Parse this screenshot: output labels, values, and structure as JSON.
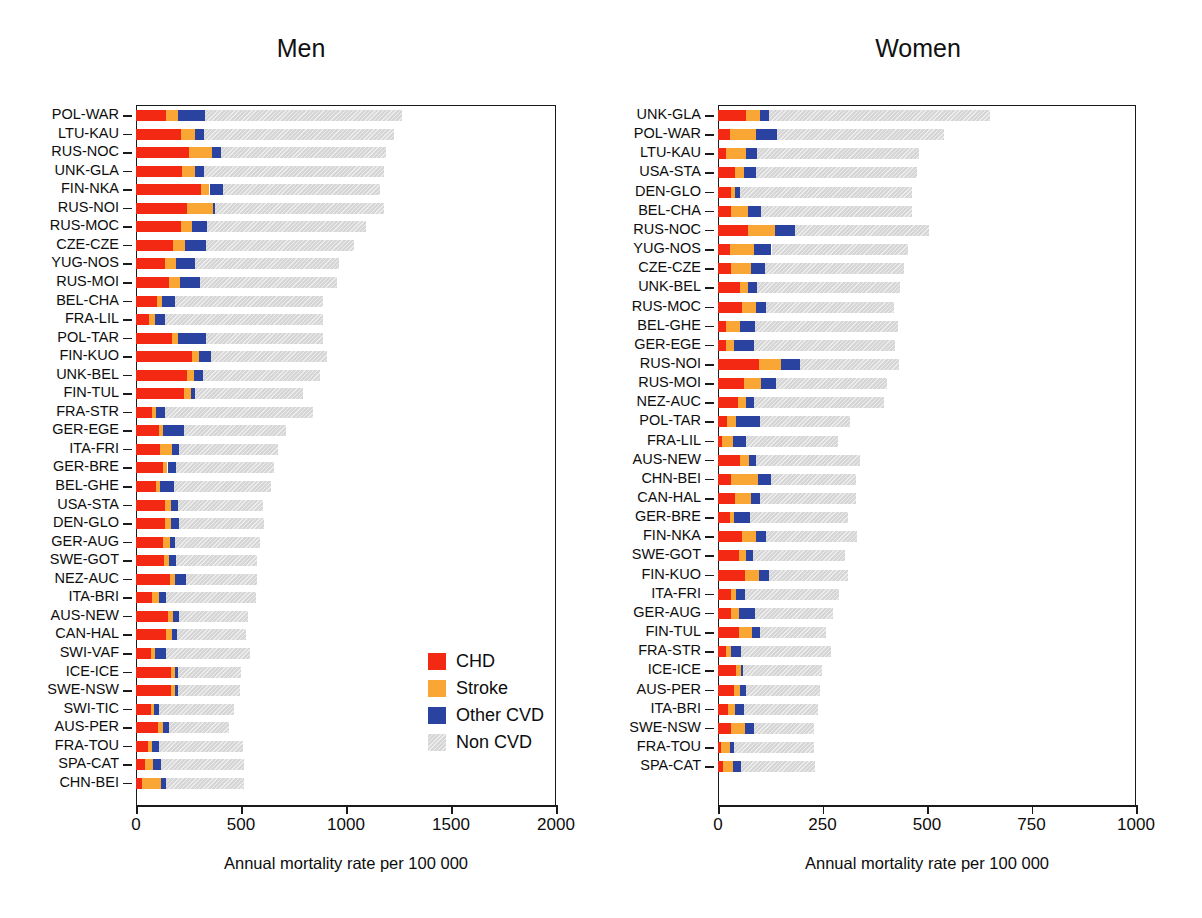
{
  "page": {
    "cropped_header_text": "",
    "background": "#ffffff"
  },
  "colors": {
    "chd": "#f42914",
    "stroke": "#f9a635",
    "other_cvd": "#2a42a0",
    "non_cvd": "#d6d6d6",
    "axis": "#1a1a1a",
    "text": "#0d0d0d"
  },
  "legend": {
    "items": [
      {
        "key": "chd",
        "label": "CHD",
        "color": "#f42914"
      },
      {
        "key": "stroke",
        "label": "Stroke",
        "color": "#f9a635"
      },
      {
        "key": "other",
        "label": "Other CVD",
        "color": "#2a42a0"
      },
      {
        "key": "non",
        "label": "Non  CVD",
        "color": "#d6d6d6"
      }
    ]
  },
  "chart_data": [
    {
      "type": "bar",
      "orientation": "horizontal",
      "stacked": true,
      "title": "Men",
      "xlabel": "Annual mortality rate per 100 000",
      "ylabel": "",
      "xlim": [
        0,
        2000
      ],
      "xticks": [
        0,
        500,
        1000,
        1500,
        2000
      ],
      "xticklabels": [
        "0",
        "500",
        "1000",
        "1500",
        "2000"
      ],
      "grid": false,
      "legend_position": "inside-lower-right",
      "series": [
        {
          "name": "CHD",
          "color": "#f42914"
        },
        {
          "name": "Stroke",
          "color": "#f9a635"
        },
        {
          "name": "Other CVD",
          "color": "#2a42a0"
        },
        {
          "name": "Non  CVD",
          "color": "#d6d6d6"
        }
      ],
      "categories": [
        "POL-WAR",
        "LTU-KAU",
        "RUS-NOC",
        "UNK-GLA",
        "FIN-NKA",
        "RUS-NOI",
        "RUS-MOC",
        "CZE-CZE",
        "YUG-NOS",
        "RUS-MOI",
        "BEL-CHA",
        "FRA-LIL",
        "POL-TAR",
        "FIN-KUO",
        "UNK-BEL",
        "FIN-TUL",
        "FRA-STR",
        "GER-EGE",
        "ITA-FRI",
        "GER-BRE",
        "BEL-GHE",
        "USA-STA",
        "DEN-GLO",
        "GER-AUG",
        "SWE-GOT",
        "NEZ-AUC",
        "ITA-BRI",
        "AUS-NEW",
        "CAN-HAL",
        "SWI-VAF",
        "ICE-ICE",
        "SWE-NSW",
        "SWI-TIC",
        "AUS-PER",
        "FRA-TOU",
        "SPA-CAT",
        "CHN-BEI"
      ],
      "values": {
        "CHD": [
          145,
          215,
          250,
          220,
          310,
          245,
          215,
          175,
          140,
          155,
          100,
          60,
          170,
          265,
          245,
          230,
          75,
          110,
          115,
          130,
          95,
          140,
          140,
          130,
          135,
          160,
          75,
          150,
          145,
          70,
          165,
          165,
          70,
          105,
          55,
          45,
          30
        ],
        "Stroke": [
          55,
          65,
          110,
          60,
          40,
          120,
          50,
          60,
          50,
          55,
          25,
          30,
          30,
          35,
          30,
          30,
          20,
          20,
          55,
          20,
          20,
          25,
          25,
          30,
          20,
          25,
          35,
          25,
          25,
          20,
          20,
          20,
          15,
          25,
          20,
          35,
          90
        ],
        "Other CVD": [
          130,
          45,
          45,
          45,
          65,
          10,
          75,
          100,
          90,
          95,
          60,
          50,
          135,
          55,
          45,
          20,
          45,
          100,
          35,
          40,
          65,
          35,
          40,
          25,
          35,
          55,
          35,
          30,
          25,
          55,
          15,
          15,
          25,
          25,
          35,
          40,
          25
        ],
        "Non  CVD": [
          935,
          905,
          785,
          855,
          745,
          805,
          755,
          705,
          685,
          650,
          705,
          750,
          555,
          555,
          555,
          515,
          705,
          485,
          470,
          465,
          465,
          405,
          405,
          405,
          385,
          335,
          425,
          330,
          330,
          400,
          300,
          295,
          355,
          290,
          400,
          395,
          370
        ]
      },
      "totals": [
        1265,
        1230,
        1190,
        1180,
        1160,
        1180,
        1095,
        1040,
        965,
        955,
        890,
        890,
        890,
        910,
        875,
        795,
        845,
        715,
        675,
        655,
        645,
        605,
        610,
        590,
        575,
        575,
        570,
        535,
        525,
        545,
        500,
        495,
        465,
        445,
        510,
        515,
        515
      ]
    },
    {
      "type": "bar",
      "orientation": "horizontal",
      "stacked": true,
      "title": "Women",
      "xlabel": "Annual mortality rate per 100 000",
      "ylabel": "",
      "xlim": [
        0,
        1000
      ],
      "xticks": [
        0,
        250,
        500,
        750,
        1000
      ],
      "xticklabels": [
        "0",
        "250",
        "500",
        "750",
        "1000"
      ],
      "grid": false,
      "legend_position": "none",
      "series": [
        {
          "name": "CHD",
          "color": "#f42914"
        },
        {
          "name": "Stroke",
          "color": "#f9a635"
        },
        {
          "name": "Other CVD",
          "color": "#2a42a0"
        },
        {
          "name": "Non  CVD",
          "color": "#d6d6d6"
        }
      ],
      "categories": [
        "UNK-GLA",
        "POL-WAR",
        "LTU-KAU",
        "USA-STA",
        "DEN-GLO",
        "BEL-CHA",
        "RUS-NOC",
        "YUG-NOS",
        "CZE-CZE",
        "UNK-BEL",
        "RUS-MOC",
        "BEL-GHE",
        "GER-EGE",
        "RUS-NOI",
        "RUS-MOI",
        "NEZ-AUC",
        "POL-TAR",
        "FRA-LIL",
        "AUS-NEW",
        "CHN-BEI",
        "CAN-HAL",
        "GER-BRE",
        "FIN-NKA",
        "SWE-GOT",
        "FIN-KUO",
        "ITA-FRI",
        "GER-AUG",
        "FIN-TUL",
        "FRA-STR",
        "ICE-ICE",
        "AUS-PER",
        "ITA-BRI",
        "SWE-NSW",
        "FRA-TOU",
        "SPA-CAT"
      ],
      "values": {
        "CHD": [
          68,
          28,
          20,
          40,
          30,
          30,
          72,
          28,
          30,
          52,
          58,
          18,
          20,
          98,
          62,
          48,
          22,
          10,
          52,
          30,
          40,
          28,
          58,
          50,
          64,
          32,
          30,
          50,
          18,
          42,
          38,
          24,
          32,
          8,
          12
        ],
        "Stroke": [
          32,
          62,
          46,
          22,
          10,
          42,
          65,
          58,
          50,
          20,
          32,
          34,
          18,
          52,
          42,
          18,
          22,
          26,
          22,
          66,
          38,
          10,
          32,
          16,
          34,
          12,
          20,
          32,
          14,
          12,
          14,
          16,
          32,
          20,
          24
        ],
        "Other CVD": [
          22,
          52,
          28,
          30,
          12,
          30,
          48,
          42,
          32,
          22,
          24,
          36,
          48,
          46,
          34,
          20,
          56,
          30,
          18,
          30,
          22,
          38,
          24,
          18,
          24,
          20,
          38,
          18,
          24,
          6,
          16,
          22,
          22,
          10,
          20
        ],
        "Non  CVD": [
          528,
          398,
          388,
          383,
          412,
          363,
          320,
          327,
          333,
          342,
          306,
          342,
          338,
          238,
          267,
          312,
          216,
          222,
          248,
          204,
          230,
          234,
          218,
          220,
          188,
          226,
          186,
          158,
          214,
          190,
          177,
          178,
          144,
          192,
          176
        ]
      },
      "totals": [
        650,
        540,
        482,
        475,
        464,
        465,
        505,
        455,
        445,
        436,
        420,
        430,
        424,
        434,
        405,
        398,
        316,
        288,
        340,
        330,
        330,
        310,
        332,
        304,
        310,
        290,
        274,
        258,
        270,
        250,
        245,
        240,
        230,
        230,
        232
      ]
    }
  ]
}
